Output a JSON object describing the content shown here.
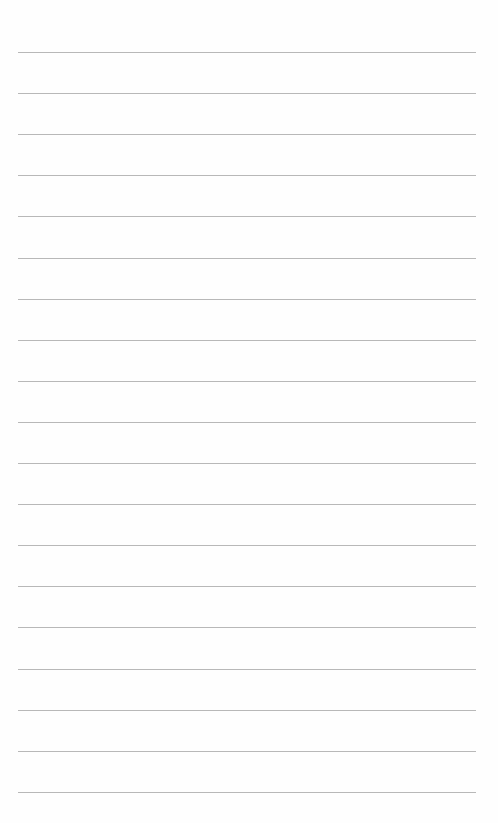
{
  "page": {
    "type": "lined-paper",
    "background_color": "#fefefe",
    "line_color": "#b8b8b8",
    "line_count": 19,
    "first_line_y": 52,
    "line_spacing": 41.1,
    "line_left": 18,
    "line_width": 458
  }
}
